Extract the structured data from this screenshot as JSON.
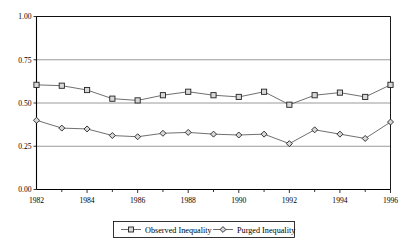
{
  "chart_data": {
    "type": "line",
    "title": "",
    "subtitle": "",
    "xlabel": "",
    "ylabel": "",
    "xlim": [
      1982,
      1996
    ],
    "ylim": [
      0.0,
      1.0
    ],
    "grid": true,
    "legend_position": "bottom",
    "x": [
      1982,
      1983,
      1984,
      1985,
      1986,
      1987,
      1988,
      1989,
      1990,
      1991,
      1992,
      1993,
      1994,
      1995,
      1996
    ],
    "xtick_labels": [
      "1982",
      "1984",
      "1986",
      "1988",
      "1990",
      "1992",
      "1994",
      "1996"
    ],
    "xtick_values": [
      1982,
      1984,
      1986,
      1988,
      1990,
      1992,
      1994,
      1996
    ],
    "xminor_tick_values": [
      1983,
      1985,
      1987,
      1989,
      1991,
      1993,
      1995
    ],
    "ytick_labels": [
      "0.00",
      "0.25",
      "0.50",
      "0.75",
      "1.00"
    ],
    "ytick_values": [
      0.0,
      0.25,
      0.5,
      0.75,
      1.0
    ],
    "series": [
      {
        "name": "Observed Inequality",
        "marker": "square",
        "values": [
          0.605,
          0.6,
          0.575,
          0.525,
          0.515,
          0.545,
          0.565,
          0.545,
          0.535,
          0.565,
          0.49,
          0.545,
          0.56,
          0.535,
          0.605
        ]
      },
      {
        "name": "Purged Inequality",
        "marker": "diamond",
        "values": [
          0.4,
          0.355,
          0.35,
          0.312,
          0.305,
          0.325,
          0.33,
          0.32,
          0.315,
          0.32,
          0.265,
          0.345,
          0.32,
          0.295,
          0.39
        ]
      }
    ]
  },
  "legend": {
    "entries": [
      {
        "label": "Observed Inequality",
        "marker": "square"
      },
      {
        "label": "Purged Inequality",
        "marker": "diamond"
      }
    ]
  },
  "colors": {
    "line": "#555555",
    "marker_fill": "#d8d8d8",
    "marker_stroke": "#222222",
    "grid": "#808080",
    "axis": "#000000",
    "background": "#ffffff"
  }
}
